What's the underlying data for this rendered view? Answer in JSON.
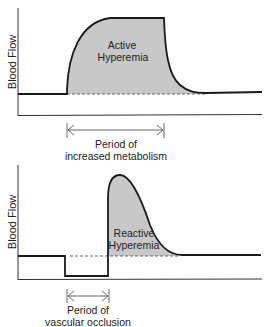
{
  "top_panel": {
    "y_label": "Blood Flow",
    "region_label_line1": "Active",
    "region_label_line2": "Hyperemia",
    "period_label_line1": "Period of",
    "period_label_line2": "increased metabolism"
  },
  "bottom_panel": {
    "y_label": "Blood Flow",
    "region_label_line1": "Reactive",
    "region_label_line2": "Hyperemia",
    "period_label_line1": "Period of",
    "period_label_line2": "vascular occlusion"
  },
  "colors": {
    "line": "#1a1a1a",
    "fill": "#c8c8c8",
    "background": "#ffffff"
  }
}
